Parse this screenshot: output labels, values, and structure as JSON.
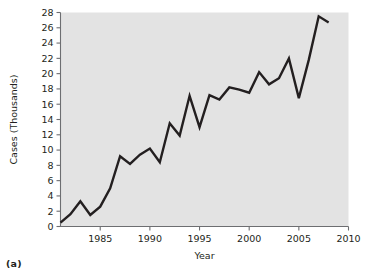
{
  "figure": {
    "caption": "(a)"
  },
  "chart_data": {
    "type": "line",
    "title": "",
    "xlabel": "Year",
    "ylabel": "Cases (Thousands)",
    "xlim": [
      1981,
      2010
    ],
    "ylim": [
      0,
      28
    ],
    "grid": false,
    "legend": null,
    "x_ticks": [
      1985,
      1990,
      1995,
      2000,
      2005,
      2010
    ],
    "x_tick_labels": [
      "1985",
      "1990",
      "1995",
      "2000",
      "2005",
      "2010"
    ],
    "y_ticks": [
      0,
      2,
      4,
      6,
      8,
      10,
      12,
      14,
      16,
      18,
      20,
      22,
      24,
      26,
      28
    ],
    "y_tick_labels": [
      "0",
      "2",
      "4",
      "6",
      "8",
      "10",
      "12",
      "14",
      "16",
      "18",
      "20",
      "22",
      "24",
      "26",
      "28"
    ],
    "line_color": "#231f20",
    "plot_background": "#e3e3e3",
    "x": [
      1981,
      1982,
      1983,
      1984,
      1985,
      1986,
      1987,
      1988,
      1989,
      1990,
      1991,
      1992,
      1993,
      1994,
      1995,
      1996,
      1997,
      1998,
      1999,
      2000,
      2001,
      2002,
      2003,
      2004,
      2005,
      2006,
      2007,
      2008
    ],
    "values": [
      0.5,
      1.6,
      3.3,
      1.5,
      2.6,
      5.0,
      9.2,
      8.2,
      9.4,
      10.2,
      8.4,
      13.5,
      11.9,
      17.1,
      13.0,
      17.2,
      16.6,
      18.2,
      17.9,
      17.5,
      20.2,
      18.6,
      19.4,
      22.0,
      16.8,
      21.8,
      27.5,
      26.7
    ]
  }
}
